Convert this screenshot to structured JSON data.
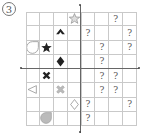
{
  "problem_label": "3",
  "grid": {
    "cols": 8,
    "rows": 8
  },
  "cells": [
    {
      "row": 0,
      "col": 3,
      "type": "star-outline",
      "text": ""
    },
    {
      "row": 0,
      "col": 6,
      "type": "question",
      "text": "?"
    },
    {
      "row": 1,
      "col": 2,
      "type": "spade-black",
      "text": ""
    },
    {
      "row": 1,
      "col": 4,
      "type": "question",
      "text": "?"
    },
    {
      "row": 1,
      "col": 7,
      "type": "question",
      "text": "?"
    },
    {
      "row": 2,
      "col": 0,
      "type": "circle-outline",
      "text": ""
    },
    {
      "row": 2,
      "col": 1,
      "type": "star-black",
      "text": ""
    },
    {
      "row": 2,
      "col": 5,
      "type": "question",
      "text": "?"
    },
    {
      "row": 2,
      "col": 7,
      "type": "question",
      "text": "?"
    },
    {
      "row": 3,
      "col": 2,
      "type": "diamond-black",
      "text": ""
    },
    {
      "row": 3,
      "col": 5,
      "type": "question",
      "text": "?"
    },
    {
      "row": 4,
      "col": 1,
      "type": "cross-black",
      "text": ""
    },
    {
      "row": 4,
      "col": 5,
      "type": "question",
      "text": "?"
    },
    {
      "row": 4,
      "col": 6,
      "type": "question",
      "text": "?"
    },
    {
      "row": 5,
      "col": 0,
      "type": "triangle-left-outline",
      "text": ""
    },
    {
      "row": 5,
      "col": 2,
      "type": "cross-gray",
      "text": ""
    },
    {
      "row": 5,
      "col": 5,
      "type": "question",
      "text": "?"
    },
    {
      "row": 5,
      "col": 6,
      "type": "question",
      "text": "?"
    },
    {
      "row": 6,
      "col": 3,
      "type": "diamond-outline",
      "text": ""
    },
    {
      "row": 6,
      "col": 4,
      "type": "question",
      "text": "?"
    },
    {
      "row": 6,
      "col": 7,
      "type": "question",
      "text": "?"
    },
    {
      "row": 7,
      "col": 1,
      "type": "drop-gray",
      "text": ""
    },
    {
      "row": 7,
      "col": 4,
      "type": "question",
      "text": "?"
    }
  ]
}
